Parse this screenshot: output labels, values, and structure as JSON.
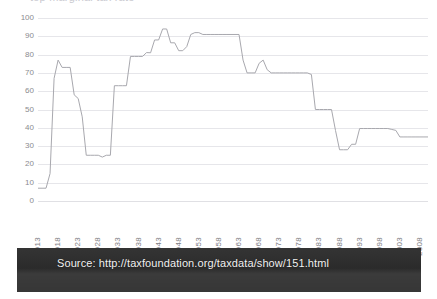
{
  "page": {
    "title_fragment": "top marginal tax rate"
  },
  "source": {
    "label": "Source:",
    "url": "http://taxfoundation.org/taxdata/show/151.html",
    "full_text": "Source: http://taxfoundation.org/taxdata/show/151.html",
    "banner_color": "#2e2e2e",
    "text_color": "#f2f2f2"
  },
  "chart_data": {
    "type": "line",
    "title": "",
    "xlabel": "",
    "ylabel": "",
    "ylim": [
      0,
      100
    ],
    "yticks": [
      0,
      10,
      20,
      30,
      40,
      50,
      60,
      70,
      80,
      90,
      100
    ],
    "xlim": [
      1913,
      2010
    ],
    "xticks": [
      1913,
      1918,
      1923,
      1928,
      1933,
      1938,
      1943,
      1948,
      1953,
      1958,
      1963,
      1968,
      1973,
      1978,
      1983,
      1988,
      1993,
      1998,
      2003,
      2008
    ],
    "xtick_labels": [
      "1913",
      "1918",
      "1923",
      "1928",
      "1933",
      "1938",
      "1943",
      "1948",
      "1953",
      "1958",
      "1963",
      "1968",
      "1973",
      "1978",
      "1983",
      "1988",
      "1993",
      "1998",
      "2003",
      "2008"
    ],
    "grid": true,
    "grid_color": "#e6e6ea",
    "legend": null,
    "line_color": "#a8a8ae",
    "line_width": 1,
    "series": [
      {
        "name": "Top marginal income tax rate (%)",
        "x": [
          1913,
          1914,
          1915,
          1916,
          1917,
          1918,
          1919,
          1920,
          1921,
          1922,
          1923,
          1924,
          1925,
          1926,
          1927,
          1928,
          1929,
          1930,
          1931,
          1932,
          1933,
          1934,
          1935,
          1936,
          1937,
          1938,
          1939,
          1940,
          1941,
          1942,
          1943,
          1944,
          1945,
          1946,
          1947,
          1948,
          1949,
          1950,
          1951,
          1952,
          1953,
          1954,
          1955,
          1956,
          1957,
          1958,
          1959,
          1960,
          1961,
          1962,
          1963,
          1964,
          1965,
          1966,
          1967,
          1968,
          1969,
          1970,
          1971,
          1972,
          1973,
          1974,
          1975,
          1976,
          1977,
          1978,
          1979,
          1980,
          1981,
          1982,
          1983,
          1984,
          1985,
          1986,
          1987,
          1988,
          1989,
          1990,
          1991,
          1992,
          1993,
          1994,
          1995,
          1996,
          1997,
          1998,
          1999,
          2000,
          2001,
          2002,
          2003,
          2004,
          2005,
          2006,
          2007,
          2008,
          2009,
          2010
        ],
        "values": [
          7,
          7,
          7,
          15,
          67,
          77,
          73,
          73,
          73,
          58,
          56,
          46,
          25,
          25,
          25,
          25,
          24,
          25,
          25,
          63,
          63,
          63,
          63,
          79,
          79,
          79,
          79,
          81.1,
          81,
          88,
          88,
          94,
          94,
          86.45,
          86.45,
          82.13,
          82.13,
          84.36,
          91,
          92,
          92,
          91,
          91,
          91,
          91,
          91,
          91,
          91,
          91,
          91,
          91,
          77,
          70,
          70,
          70,
          75.25,
          77,
          71.75,
          70,
          70,
          70,
          70,
          70,
          70,
          70,
          70,
          70,
          70,
          69.125,
          50,
          50,
          50,
          50,
          50,
          38.5,
          28,
          28,
          28,
          31,
          31,
          39.6,
          39.6,
          39.6,
          39.6,
          39.6,
          39.6,
          39.6,
          39.6,
          39.1,
          38.6,
          35,
          35,
          35,
          35,
          35,
          35,
          35,
          35
        ]
      }
    ]
  },
  "yaxis": {
    "labels": [
      "100",
      "90",
      "80",
      "70",
      "60",
      "50",
      "40",
      "30",
      "20",
      "10",
      "0"
    ]
  }
}
